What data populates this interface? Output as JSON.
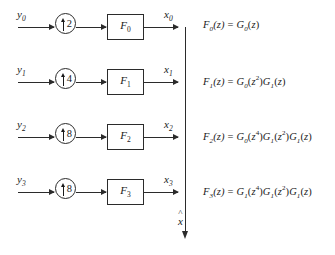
{
  "diagram": {
    "bus": {
      "output_label": "x",
      "output_hat": "^",
      "arrow_direction": "down"
    },
    "branches": [
      {
        "input_label": "y",
        "input_sub": "0",
        "upsample_factor": "2",
        "upsample_arrow": "up-arrow",
        "filter_label": "F",
        "filter_sub": "0",
        "output_label": "x",
        "output_sub": "0",
        "equation": {
          "lhs_fn": "F",
          "lhs_sub": "0",
          "lhs_arg": "(z)",
          "equals": "=",
          "terms": [
            {
              "fn": "G",
              "sub": "0",
              "arg": "z",
              "exp": ""
            }
          ]
        }
      },
      {
        "input_label": "y",
        "input_sub": "1",
        "upsample_factor": "4",
        "upsample_arrow": "up-arrow",
        "filter_label": "F",
        "filter_sub": "1",
        "output_label": "x",
        "output_sub": "1",
        "equation": {
          "lhs_fn": "F",
          "lhs_sub": "1",
          "lhs_arg": "(z)",
          "equals": "=",
          "terms": [
            {
              "fn": "G",
              "sub": "0",
              "arg": "z",
              "exp": "2"
            },
            {
              "fn": "G",
              "sub": "1",
              "arg": "z",
              "exp": ""
            }
          ]
        }
      },
      {
        "input_label": "y",
        "input_sub": "2",
        "upsample_factor": "8",
        "upsample_arrow": "up-arrow",
        "filter_label": "F",
        "filter_sub": "2",
        "output_label": "x",
        "output_sub": "2",
        "equation": {
          "lhs_fn": "F",
          "lhs_sub": "2",
          "lhs_arg": "(z)",
          "equals": "=",
          "terms": [
            {
              "fn": "G",
              "sub": "0",
              "arg": "z",
              "exp": "4"
            },
            {
              "fn": "G",
              "sub": "1",
              "arg": "z",
              "exp": "2"
            },
            {
              "fn": "G",
              "sub": "1",
              "arg": "z",
              "exp": ""
            }
          ]
        }
      },
      {
        "input_label": "y",
        "input_sub": "3",
        "upsample_factor": "8",
        "upsample_arrow": "up-arrow",
        "filter_label": "F",
        "filter_sub": "3",
        "output_label": "x",
        "output_sub": "3",
        "equation": {
          "lhs_fn": "F",
          "lhs_sub": "3",
          "lhs_arg": "(z)",
          "equals": "=",
          "terms": [
            {
              "fn": "G",
              "sub": "1",
              "arg": "z",
              "exp": "4"
            },
            {
              "fn": "G",
              "sub": "1",
              "arg": "z",
              "exp": "2"
            },
            {
              "fn": "G",
              "sub": "1",
              "arg": "z",
              "exp": ""
            }
          ]
        }
      }
    ],
    "colors": {
      "line": "#2b2b2b",
      "text": "#1a1a1a",
      "background": "#ffffff"
    }
  }
}
